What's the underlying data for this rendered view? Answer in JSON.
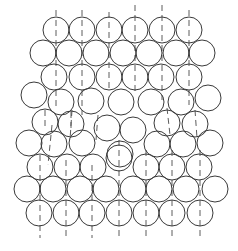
{
  "diagram": {
    "stroke_color": "#3a3a3a",
    "background": "#ffffff",
    "radius": 13,
    "circles": [
      [
        56,
        30
      ],
      [
        82,
        30
      ],
      [
        109,
        30
      ],
      [
        135,
        30
      ],
      [
        162,
        30
      ],
      [
        189,
        30
      ],
      [
        43,
        53
      ],
      [
        69,
        53
      ],
      [
        96,
        53
      ],
      [
        123,
        53
      ],
      [
        149,
        53
      ],
      [
        176,
        53
      ],
      [
        202,
        53
      ],
      [
        54,
        77
      ],
      [
        82,
        77
      ],
      [
        109,
        77
      ],
      [
        135,
        77
      ],
      [
        161,
        77
      ],
      [
        189,
        77
      ],
      [
        34,
        95
      ],
      [
        61,
        102
      ],
      [
        91,
        101
      ],
      [
        121,
        102
      ],
      [
        151,
        102
      ],
      [
        181,
        102
      ],
      [
        208,
        98
      ],
      [
        45,
        122
      ],
      [
        71,
        124
      ],
      [
        107,
        128
      ],
      [
        133,
        130
      ],
      [
        167,
        123
      ],
      [
        195,
        124
      ],
      [
        29,
        143
      ],
      [
        54,
        144
      ],
      [
        82,
        143
      ],
      [
        120,
        154
      ],
      [
        157,
        144
      ],
      [
        183,
        144
      ],
      [
        210,
        143
      ],
      [
        40,
        167
      ],
      [
        67,
        167
      ],
      [
        93,
        167
      ],
      [
        119,
        158
      ],
      [
        146,
        167
      ],
      [
        172,
        167
      ],
      [
        199,
        167
      ],
      [
        27,
        189
      ],
      [
        53,
        189
      ],
      [
        80,
        189
      ],
      [
        106,
        189
      ],
      [
        133,
        189
      ],
      [
        159,
        189
      ],
      [
        186,
        189
      ],
      [
        215,
        189
      ],
      [
        39,
        213
      ],
      [
        66,
        213
      ],
      [
        92,
        213
      ],
      [
        119,
        213
      ],
      [
        146,
        213
      ],
      [
        172,
        213
      ],
      [
        200,
        213
      ]
    ],
    "dashed_lines": [
      [
        56,
        10,
        56,
        110
      ],
      [
        82,
        10,
        82,
        115
      ],
      [
        109,
        12,
        109,
        90
      ],
      [
        135,
        5,
        135,
        95
      ],
      [
        162,
        5,
        162,
        100
      ],
      [
        189,
        10,
        189,
        105
      ],
      [
        52,
        125,
        48,
        165
      ],
      [
        72,
        110,
        70,
        140
      ],
      [
        98,
        115,
        96,
        140
      ],
      [
        40,
        155,
        40,
        238
      ],
      [
        66,
        160,
        66,
        238
      ],
      [
        92,
        165,
        92,
        238
      ],
      [
        119,
        140,
        119,
        238
      ],
      [
        146,
        150,
        146,
        238
      ],
      [
        172,
        150,
        172,
        238
      ],
      [
        200,
        150,
        200,
        238
      ],
      [
        45,
        110,
        45,
        130
      ],
      [
        71,
        112,
        71,
        132
      ],
      [
        167,
        108,
        170,
        135
      ],
      [
        195,
        110,
        197,
        138
      ]
    ]
  }
}
